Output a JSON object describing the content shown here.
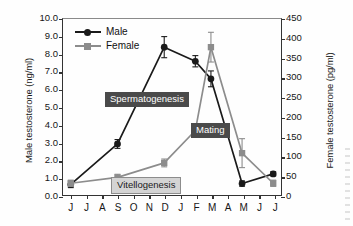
{
  "chart_data": {
    "type": "line",
    "title": "",
    "xlabel": "",
    "categories": [
      "J",
      "J",
      "A",
      "S",
      "O",
      "N",
      "D",
      "J",
      "F",
      "M",
      "A",
      "M",
      "J",
      "J"
    ],
    "axes": {
      "left": {
        "label": "Male testosterone (ng/ml)",
        "ticks": [
          "0.0",
          "1.0",
          "2.0",
          "3.0",
          "4.0",
          "5.0",
          "6.0",
          "7.0",
          "8.0",
          "9.0",
          "10.0"
        ],
        "min": 0.0,
        "max": 10.0,
        "step": 1.0,
        "units": "ng/ml"
      },
      "right": {
        "label": "Female testosterone (pg/ml)",
        "ticks": [
          "0",
          "50",
          "100",
          "150",
          "200",
          "250",
          "300",
          "350",
          "400",
          "450"
        ],
        "min": 0,
        "max": 450,
        "step": 50,
        "units": "pg/ml"
      },
      "grid": false
    },
    "legend": {
      "position": "top-left",
      "entries": [
        {
          "name": "Male",
          "color": "#1a1a1a",
          "marker": "circle"
        },
        {
          "name": "Female",
          "color": "#8c8c8c",
          "marker": "square"
        }
      ]
    },
    "series": [
      {
        "name": "Male",
        "axis": "left",
        "color": "#1a1a1a",
        "marker": "circle",
        "points": [
          {
            "month": "J",
            "index": 0,
            "value": 0.6,
            "err": 0.18
          },
          {
            "month": "S",
            "index": 3,
            "value": 2.9,
            "err": 0.25
          },
          {
            "month": "D",
            "index": 6,
            "value": 8.4,
            "err": 0.6
          },
          {
            "month": "F",
            "index": 8,
            "value": 7.6,
            "err": 0.32
          },
          {
            "month": "M",
            "index": 9,
            "value": 6.6,
            "err": 0.45
          },
          {
            "month": "M",
            "index": 11,
            "value": 0.65,
            "err": 0.15
          },
          {
            "month": "J",
            "index": 13,
            "value": 1.2,
            "err": 0.12
          }
        ]
      },
      {
        "name": "Female",
        "axis": "right",
        "color": "#8c8c8c",
        "marker": "square",
        "points": [
          {
            "month": "J",
            "index": 0,
            "value": 30,
            "err": 8
          },
          {
            "month": "S",
            "index": 3,
            "value": 45,
            "err": 8
          },
          {
            "month": "D",
            "index": 6,
            "value": 82,
            "err": 10
          },
          {
            "month": "F",
            "index": 8,
            "value": 165,
            "err": 14
          },
          {
            "month": "M",
            "index": 9,
            "value": 378,
            "err": 38
          },
          {
            "month": "M",
            "index": 11,
            "value": 107,
            "err": 37
          },
          {
            "month": "J",
            "index": 13,
            "value": 30,
            "err": 8
          }
        ]
      }
    ],
    "annotations": [
      {
        "id": "spermatogenesis",
        "text": "Spermatogenesis",
        "style": "dark"
      },
      {
        "id": "mating",
        "text": "Mating",
        "style": "dark"
      },
      {
        "id": "vitellogenesis",
        "text": "Vitellogenesis",
        "style": "light"
      }
    ],
    "colors": {
      "male": "#1a1a1a",
      "female": "#8c8c8c",
      "annotation_dark_bg": "#4a4a4a",
      "annotation_light_bg": "#d4d4d4",
      "axis": "#333333"
    }
  }
}
